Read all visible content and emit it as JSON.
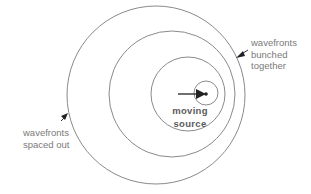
{
  "diagram": {
    "wavefronts": [
      {
        "name": "outer",
        "cx": 156,
        "cy": 95,
        "r": 89
      },
      {
        "name": "second",
        "cx": 172,
        "cy": 94,
        "r": 63
      },
      {
        "name": "third",
        "cx": 188,
        "cy": 94,
        "r": 37
      },
      {
        "name": "innermost",
        "cx": 206,
        "cy": 93,
        "r": 12
      }
    ],
    "colors": {
      "circle": "#8a8a8a",
      "arrow": "#222222",
      "label": "#7a7a7a"
    },
    "labels": {
      "bunched": [
        "wavefronts",
        "bunched",
        "together"
      ],
      "spaced": [
        "wavefronts",
        "spaced out"
      ],
      "source": [
        "moving",
        "source"
      ]
    }
  }
}
